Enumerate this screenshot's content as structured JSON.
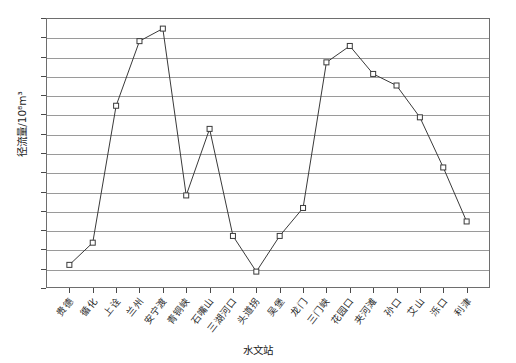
{
  "chart_data": {
    "type": "line",
    "title": "",
    "xlabel": "水文站",
    "ylabel": "径流量/10⁸m³",
    "ylim": [
      200,
      340
    ],
    "ytick_step": 10,
    "grid": true,
    "legend": "none",
    "marker": "open-square",
    "line_color": "#3a3a3a",
    "grid_color": "#9a9a9a",
    "frame_color": "#6e6e6e",
    "yticks": [
      200,
      210,
      220,
      230,
      240,
      250,
      260,
      270,
      280,
      290,
      300,
      310,
      320,
      330,
      340
    ],
    "categories": [
      "贵德",
      "循化",
      "上诠",
      "兰州",
      "安宁渡",
      "青铜峡",
      "石嘴山",
      "三湖河口",
      "头道拐",
      "吴堡",
      "龙门",
      "三门峡",
      "花园口",
      "夹河滩",
      "孙口",
      "艾山",
      "泺口",
      "利津"
    ],
    "values": [
      212.0,
      223.5,
      294.5,
      328.0,
      334.5,
      248.0,
      282.5,
      227.0,
      208.5,
      227.0,
      241.5,
      317.0,
      325.5,
      311.0,
      305.0,
      288.5,
      262.5,
      234.5
    ]
  }
}
